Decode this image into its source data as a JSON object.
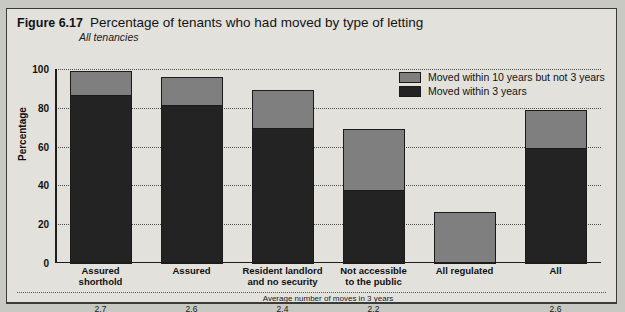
{
  "figure": {
    "number": "Figure 6.17",
    "title": "Percentage of tenants who had moved by type of letting",
    "subtitle": "All tenancies"
  },
  "chart_data": {
    "type": "bar",
    "stacked": true,
    "title": "Percentage of tenants who had moved by type of letting",
    "subtitle": "All tenancies",
    "xlabel": "",
    "ylabel": "Percentage",
    "ylim": [
      0,
      100
    ],
    "yticks": [
      0,
      20,
      40,
      60,
      80,
      100
    ],
    "grid": true,
    "legend_position": "top-right",
    "categories": [
      "Assured\nshorthold",
      "Assured",
      "Resident landlord\nand no security",
      "Not accessible\nto the public",
      "All regulated",
      "All"
    ],
    "series": [
      {
        "name": "Moved within 3 years",
        "color": "#232323",
        "values": [
          87,
          82,
          70,
          38,
          0,
          60
        ]
      },
      {
        "name": "Moved within 10 years but not 3 years",
        "color": "#7f7f7f",
        "values": [
          13,
          15,
          20,
          32,
          27,
          20
        ]
      }
    ],
    "totals": [
      100,
      97,
      90,
      70,
      27,
      80
    ],
    "footnote_label": "Average number of moves in 3 years",
    "footnote_values": [
      "2.7",
      "2.6",
      "2.4",
      "2.2",
      "",
      "2.6"
    ]
  },
  "legend": {
    "items": [
      {
        "label": "Moved within 10 years but not 3 years",
        "color": "#7f7f7f"
      },
      {
        "label": "Moved within 3 years",
        "color": "#232323"
      }
    ]
  },
  "axis": {
    "y_label": "Percentage",
    "y_ticks": [
      "100",
      "80",
      "60",
      "40",
      "20",
      "0"
    ]
  },
  "categories": [
    {
      "line1": "Assured",
      "line2": "shorthold"
    },
    {
      "line1": "Assured",
      "line2": ""
    },
    {
      "line1": "Resident landlord",
      "line2": "and no security"
    },
    {
      "line1": "Not accessible",
      "line2": "to the public"
    },
    {
      "line1": "All regulated",
      "line2": ""
    },
    {
      "line1": "All",
      "line2": ""
    }
  ],
  "footnote": {
    "label": "Average number of moves in 3 years",
    "values": [
      "2.7",
      "2.6",
      "2.4",
      "2.2",
      "",
      "2.6"
    ]
  }
}
